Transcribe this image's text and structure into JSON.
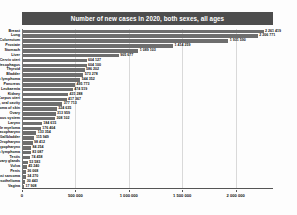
{
  "chart": {
    "title": "Number of new cases in 2020, both sexes, all ages",
    "accent_bar_color": "#6e6e6e",
    "title_band_color": "#4d4d4d"
  },
  "chart_data": {
    "type": "bar",
    "orientation": "horizontal",
    "title": "Number of new cases in 2020, both sexes, all ages",
    "xlabel": "",
    "ylabel": "",
    "xlim": [
      0,
      2350000
    ],
    "grid": true,
    "legend_position": "none",
    "xticks": [
      0,
      500000,
      1000000,
      1500000,
      2000000
    ],
    "xtick_labels": [
      "0",
      "500 000",
      "1 000 000",
      "1 500 000",
      "2 000 000"
    ],
    "categories": [
      "Breast",
      "Lung",
      "Colorectum",
      "Prostate",
      "Stomach",
      "Liver",
      "Cervix uteri",
      "Oesophagus",
      "Thyroid",
      "Bladder",
      "Non-Hodgkin lymphoma",
      "Pancreas",
      "Leukaemia",
      "Kidney",
      "Corpus uteri",
      "Lip, oral cavity",
      "Melanoma of skin",
      "Ovary",
      "Brain, central nervous system",
      "Larynx",
      "Multiple myeloma",
      "Nasopharynx",
      "Gallbladder",
      "Oropharynx",
      "Hypopharynx",
      "Hodgkin lymphoma",
      "Testis",
      "Salivary glands",
      "Vulva",
      "Penis",
      "Kaposi sarcoma",
      "Mesothelioma",
      "Vagina"
    ],
    "values": [
      2261419,
      2206771,
      1931590,
      1414259,
      1089103,
      905677,
      604127,
      604100,
      586202,
      573278,
      544352,
      495773,
      474519,
      431288,
      417367,
      377713,
      324635,
      313959,
      308102,
      184615,
      176404,
      133354,
      115949,
      98412,
      84254,
      83087,
      74458,
      53583,
      45240,
      36068,
      34270,
      30443,
      17908
    ],
    "value_labels": [
      "2 261 419",
      "2 206 771",
      "1 931 590",
      "1 414 259",
      "1 089 103",
      "905 677",
      "604 127",
      "604 100",
      "586 202",
      "573 278",
      "544 352",
      "495 773",
      "474 519",
      "431 288",
      "417 367",
      "377 713",
      "324 635",
      "313 959",
      "308 102",
      "184 615",
      "176 404",
      "133 354",
      "115 949",
      "98 412",
      "84 254",
      "83 087",
      "74 458",
      "53 583",
      "45 240",
      "36 068",
      "34 270",
      "30 443",
      "17 908"
    ]
  }
}
